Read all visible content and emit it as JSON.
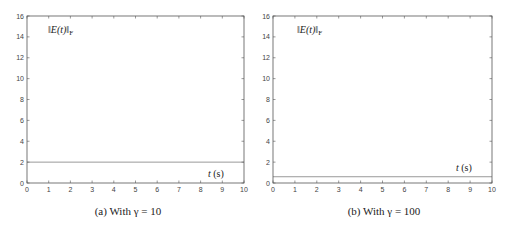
{
  "chart_data": [
    {
      "type": "line",
      "title": "",
      "caption": "(a) With γ = 10",
      "xlabel": "t (s)",
      "ylabel": "‖E(t)‖F",
      "xlim": [
        0,
        10
      ],
      "ylim": [
        0,
        16
      ],
      "xticks": [
        0,
        1,
        2,
        3,
        4,
        5,
        6,
        7,
        8,
        9,
        10
      ],
      "yticks": [
        0,
        2,
        4,
        6,
        8,
        10,
        12,
        14,
        16
      ],
      "grid": false,
      "series": [
        {
          "name": "‖E(t)‖F",
          "x": [
            0,
            10
          ],
          "values": [
            2.0,
            2.0
          ],
          "color": "#9a9a9a"
        }
      ]
    },
    {
      "type": "line",
      "title": "",
      "caption": "(b) With γ = 100",
      "xlabel": "t (s)",
      "ylabel": "‖E(t)‖F",
      "xlim": [
        0,
        10
      ],
      "ylim": [
        0,
        16
      ],
      "xticks": [
        0,
        1,
        2,
        3,
        4,
        5,
        6,
        7,
        8,
        9,
        10
      ],
      "yticks": [
        0,
        2,
        4,
        6,
        8,
        10,
        12,
        14,
        16
      ],
      "grid": false,
      "series": [
        {
          "name": "‖E(t)‖F",
          "x": [
            0,
            10
          ],
          "values": [
            0.6,
            0.6
          ],
          "color": "#9a9a9a"
        }
      ]
    }
  ],
  "panels": [
    {
      "norm_label_main": "‖E(t)‖",
      "norm_label_sub": "F",
      "time_label_var": "t",
      "time_label_unit": "(s)",
      "caption": "(a) With γ = 10"
    },
    {
      "norm_label_main": "‖E(t)‖",
      "norm_label_sub": "F",
      "time_label_var": "t",
      "time_label_unit": "(s)",
      "caption": "(b) With γ = 100"
    }
  ],
  "colors": {
    "axis": "#555555",
    "line": "#9a9a9a"
  }
}
